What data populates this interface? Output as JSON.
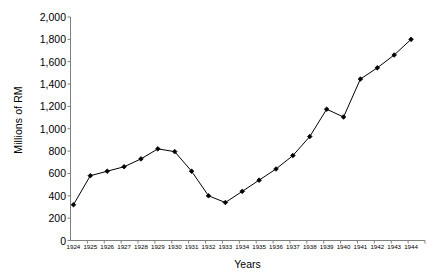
{
  "chart_data": {
    "type": "line",
    "title": "",
    "xlabel": "Years",
    "ylabel": "Millions of RM",
    "categories": [
      1924,
      1925,
      1926,
      1927,
      1928,
      1929,
      1930,
      1931,
      1932,
      1933,
      1934,
      1935,
      1936,
      1937,
      1938,
      1939,
      1940,
      1941,
      1942,
      1943,
      1944
    ],
    "x_tick_labels": [
      "1924",
      "1925",
      "1926",
      "1927",
      "1928",
      "1929",
      "1930",
      "1931",
      "1932",
      "1933",
      "1934",
      "1935",
      "1936",
      "1937",
      "1938",
      "1939",
      "1940",
      "1941",
      "1942",
      "1943",
      "1944"
    ],
    "values": [
      320,
      580,
      620,
      660,
      730,
      820,
      795,
      620,
      400,
      340,
      440,
      540,
      640,
      760,
      930,
      1175,
      1105,
      1445,
      1545,
      1660,
      1800
    ],
    "series": [
      {
        "name": "Millions of RM",
        "values": [
          320,
          580,
          620,
          660,
          730,
          820,
          795,
          620,
          400,
          340,
          440,
          540,
          640,
          760,
          930,
          1175,
          1105,
          1445,
          1545,
          1660,
          1800
        ]
      }
    ],
    "ylim": [
      0,
      2000
    ],
    "ytick_step": 200,
    "y_tick_labels": [
      "2,000",
      "1,800",
      "1,600",
      "1,400",
      "1,200",
      "1,000",
      "800",
      "600",
      "400",
      "200",
      "0"
    ],
    "y_tick_values": [
      2000,
      1800,
      1600,
      1400,
      1200,
      1000,
      800,
      600,
      400,
      200,
      0
    ],
    "grid": false,
    "legend": "none",
    "marker": "filled-diamond",
    "line_color": "#000000",
    "marker_color": "#000000",
    "axis_color": "#808080",
    "background": "#ffffff"
  }
}
